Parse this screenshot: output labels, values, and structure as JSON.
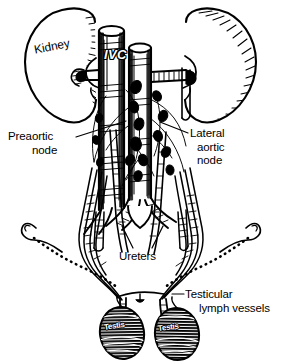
{
  "figure": {
    "background_color": "#ffffff",
    "ink_color": "#000000",
    "width": 281,
    "height": 361
  },
  "labels": {
    "kidney": "Kidney",
    "ivc": "IVC",
    "preaortic_line1": "Preaortic",
    "preaortic_line2": "node",
    "lateral_aortic_line1": "Lateral",
    "lateral_aortic_line2": "aortic",
    "lateral_aortic_line3": "node",
    "ureters": "Ureters",
    "testicular_line1": "Testicular",
    "testicular_line2": "lymph vessels",
    "testis_left": "Testis",
    "testis_right": "Testis"
  },
  "structures": [
    {
      "name": "left-kidney",
      "label": "Kidney"
    },
    {
      "name": "right-kidney",
      "label": "Kidney"
    },
    {
      "name": "inferior-vena-cava",
      "label": "IVC"
    },
    {
      "name": "abdominal-aorta",
      "label": "Aorta"
    },
    {
      "name": "renal-vessels",
      "label": "Renal vessels"
    },
    {
      "name": "preaortic-nodes",
      "label": "Preaortic node"
    },
    {
      "name": "lateral-aortic-nodes",
      "label": "Lateral aortic node"
    },
    {
      "name": "ureters",
      "label": "Ureters"
    },
    {
      "name": "common-iliac-vessels",
      "label": "Common iliac vessels"
    },
    {
      "name": "testicular-lymph-vessels",
      "label": "Testicular lymph vessels"
    },
    {
      "name": "left-testis",
      "label": "Testis"
    },
    {
      "name": "right-testis",
      "label": "Testis"
    }
  ]
}
